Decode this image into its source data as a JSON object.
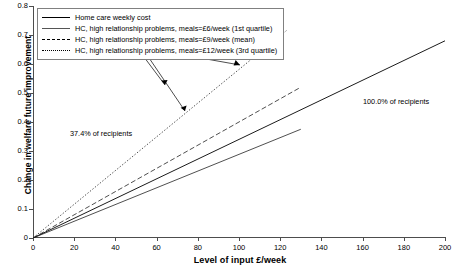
{
  "chart_data": {
    "type": "line",
    "title": "",
    "xlabel": "Level of input £/week",
    "ylabel": "Change in welfare future improvement",
    "xlim": [
      0,
      200
    ],
    "ylim": [
      0,
      0.8
    ],
    "xticks": [
      0,
      20,
      40,
      60,
      80,
      100,
      120,
      140,
      160,
      180,
      200
    ],
    "yticks": [
      "0",
      "0.1",
      "0.2",
      "0.3",
      "0.4",
      "0.5",
      "0.6",
      "0.7",
      "0.8"
    ],
    "grid": false,
    "legend_position": "top-left",
    "series": [
      {
        "name": "Home care weekly cost",
        "style": "solid",
        "width": "thick",
        "x": [
          0,
          200
        ],
        "y": [
          0,
          0.68
        ]
      },
      {
        "name": "HC, high relationship problems, meals=£6/week (1st quartile)",
        "style": "solid",
        "width": "thin",
        "x": [
          0,
          130
        ],
        "y": [
          0,
          0.375
        ]
      },
      {
        "name": "HC, high relationship problems, meals=£9/week (mean)",
        "style": "dashed",
        "width": "thin",
        "x": [
          0,
          130
        ],
        "y": [
          0,
          0.52
        ]
      },
      {
        "name": "HC, high relationship problems, meals=£12/week (3rd quartile)",
        "style": "dotted",
        "width": "thin",
        "x": [
          0,
          123
        ],
        "y": [
          0,
          0.715
        ]
      }
    ],
    "annotations": [
      {
        "text": "37.4% of recipients",
        "x": 22,
        "y": 0.36
      },
      {
        "text": "100.0% of recipients",
        "x": 161,
        "y": 0.465
      }
    ]
  },
  "legend": {
    "entries": [
      {
        "label": "Home care weekly cost",
        "key": "k-solid-thick"
      },
      {
        "label": "HC, high relationship problems, meals=£6/week (1st quartile)",
        "key": "k-solid-thin"
      },
      {
        "label": "HC, high relationship problems, meals=£9/week (mean)",
        "key": "k-dash"
      },
      {
        "label": "HC, high relationship problems, meals=£12/week (3rd quartile)",
        "key": "k-dot"
      }
    ]
  },
  "axes": {
    "y_title": "Change in welfare future improvement",
    "x_title": "Level of input £/week",
    "y_tick_labels": [
      "0.8",
      "0.7",
      "0.6",
      "0.5",
      "0.4",
      "0.3",
      "0.2",
      "0.1",
      "0"
    ],
    "x_tick_labels": [
      "0",
      "20",
      "40",
      "60",
      "80",
      "100",
      "120",
      "140",
      "160",
      "180",
      "200"
    ]
  },
  "annotations": {
    "left": "37.4% of recipients",
    "right": "100.0% of recipients"
  },
  "colors": {
    "axis": "#4d4d4d",
    "line": "#000000",
    "background": "#ffffff"
  }
}
